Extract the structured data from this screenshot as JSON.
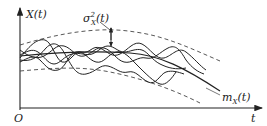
{
  "diagram": {
    "type": "random-process-realizations",
    "axes": {
      "y_label": "X(t)",
      "x_label": "t",
      "origin_label": "O"
    },
    "annotations": {
      "variance_label_base": "σ",
      "variance_label_sup": "2",
      "variance_label_sub": "X",
      "variance_label_arg": "(t)",
      "mean_label_base": "m",
      "mean_label_sub": "X",
      "mean_label_arg": "(t)"
    },
    "elements": {
      "upper_bound": "dashed curve",
      "lower_bound": "dashed curve",
      "mean_curve": "solid decreasing curve m_X(t)",
      "realizations_count": 5
    },
    "colors": {
      "line": "#222222",
      "background": "#ffffff"
    }
  }
}
